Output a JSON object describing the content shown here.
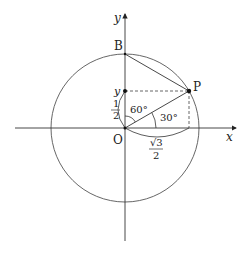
{
  "diagram": {
    "axes": {
      "x_label": "x",
      "y_label": "y"
    },
    "points": {
      "origin": "O",
      "top": "B",
      "point": "P",
      "y_projection": "y"
    },
    "fractions": {
      "half": {
        "numerator": "1",
        "denominator": "2"
      },
      "sqrt3_half": {
        "numerator": "√3",
        "denominator": "2"
      }
    },
    "angles": {
      "angle_from_y_axis": "60°",
      "angle_from_x_axis": "30°"
    },
    "colors": {
      "line": "#333333",
      "circle": "#555555",
      "dashed": "#555555"
    }
  }
}
